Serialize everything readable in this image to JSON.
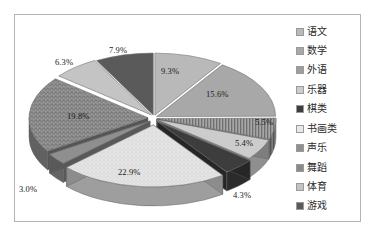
{
  "chart_data": {
    "type": "pie",
    "title": "",
    "subtitle": "",
    "xlabel": "",
    "ylabel": "",
    "legend_position": "right",
    "grid": false,
    "three_d": true,
    "categories": [
      "语文",
      "数学",
      "外语",
      "乐器",
      "棋类",
      "书画类",
      "声乐",
      "舞蹈",
      "体育",
      "游戏"
    ],
    "values": [
      9.3,
      15.6,
      5.5,
      5.4,
      4.3,
      22.9,
      3.0,
      19.8,
      6.3,
      7.9
    ],
    "value_unit": "%",
    "data_labels": [
      "9.3%",
      "15.6%",
      "5.5%",
      "5.4%",
      "4.3%",
      "22.9%",
      "3.0%",
      "19.8%",
      "6.3%",
      "7.9%"
    ],
    "slices": [
      {
        "label": "语文",
        "value": 9.3,
        "data_label": "9.3%",
        "color": "#b9b9b9",
        "pattern": "solid"
      },
      {
        "label": "数学",
        "value": 15.6,
        "data_label": "15.6%",
        "color": "#a8a8a8",
        "pattern": "solid"
      },
      {
        "label": "外语",
        "value": 5.5,
        "data_label": "5.5%",
        "color": "#9e9e9e",
        "pattern": "hatch-vertical"
      },
      {
        "label": "乐器",
        "value": 5.4,
        "data_label": "5.4%",
        "color": "#cccccc",
        "pattern": "solid"
      },
      {
        "label": "棋类",
        "value": 4.3,
        "data_label": "4.3%",
        "color": "#3d3d3d",
        "pattern": "solid"
      },
      {
        "label": "书画类",
        "value": 22.9,
        "data_label": "22.9%",
        "color": "#e2e2e2",
        "pattern": "speckle-light"
      },
      {
        "label": "声乐",
        "value": 3.0,
        "data_label": "3.0%",
        "color": "#8f8f8f",
        "pattern": "solid"
      },
      {
        "label": "舞蹈",
        "value": 19.8,
        "data_label": "19.8%",
        "color": "#8a8a8a",
        "pattern": "speckle-dark"
      },
      {
        "label": "体育",
        "value": 6.3,
        "data_label": "6.3%",
        "color": "#c4c4c4",
        "pattern": "solid"
      },
      {
        "label": "游戏",
        "value": 7.9,
        "data_label": "7.9%",
        "color": "#5a5a5a",
        "pattern": "solid"
      }
    ]
  },
  "legend": {
    "items": [
      {
        "label": "语文",
        "color": "#b9b9b9"
      },
      {
        "label": "数学",
        "color": "#a8a8a8"
      },
      {
        "label": "外语",
        "color": "#9e9e9e"
      },
      {
        "label": "乐器",
        "color": "#cccccc"
      },
      {
        "label": "棋类",
        "color": "#3d3d3d"
      },
      {
        "label": "书画类",
        "color": "#e8e8e8"
      },
      {
        "label": "声乐",
        "color": "#8f8f8f"
      },
      {
        "label": "舞蹈",
        "color": "#8a8a8a"
      },
      {
        "label": "体育",
        "color": "#c4c4c4"
      },
      {
        "label": "游戏",
        "color": "#5a5a5a"
      }
    ]
  },
  "labels": {
    "l0": "9.3%",
    "l1": "15.6%",
    "l2": "5.5%",
    "l3": "5.4%",
    "l4": "4.3%",
    "l5": "22.9%",
    "l6": "3.0%",
    "l7": "19.8%",
    "l8": "6.3%",
    "l9": "7.9%"
  },
  "colors": {
    "frame_border": "#b4b4b4",
    "background": "#ffffff",
    "text": "#1a1a1a"
  }
}
